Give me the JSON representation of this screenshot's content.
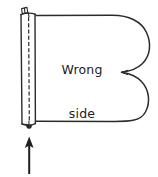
{
  "figure": {
    "kind": "hand-drawn sewing illustration",
    "canvas": {
      "width": 158,
      "height": 177
    },
    "ink_color": "#2b2b2b",
    "background_color": "#ffffff",
    "labels": {
      "fabric_label_line1": "Wrong",
      "fabric_label_line2": "side"
    },
    "parts": [
      {
        "name": "fabric-body-outline",
        "description": "rounded B-shaped fabric piece outline, open on the left"
      },
      {
        "name": "band-strip",
        "description": "vertical folded band strip attached along the left edge"
      },
      {
        "name": "band-stitch-line",
        "description": "dashed stitching line running down the centre of the band"
      },
      {
        "name": "band-top-tab",
        "description": "small folded tab at the top end of the band"
      },
      {
        "name": "band-bottom-knot",
        "description": "small dark knot/tab at the bottom end of the band"
      },
      {
        "name": "pointer-arrow",
        "description": "upward arrow pointing at the bottom of the band"
      }
    ]
  }
}
